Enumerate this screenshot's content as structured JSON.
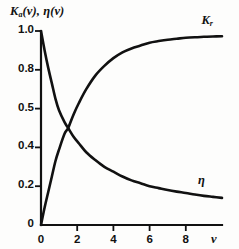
{
  "figure": {
    "background_color": "#fdfdfc",
    "ink_color": "#111111"
  },
  "labels": {
    "y_axis_title_k": "K",
    "y_axis_title_k_sub": "a",
    "y_axis_title_mid": "(v), ",
    "y_axis_title_eta": "η(v)",
    "x_axis_name": "v",
    "curve_k_label": "K",
    "curve_k_label_sub": "r",
    "curve_eta_label": "η"
  },
  "chart_data": {
    "type": "line",
    "xlabel": "v",
    "ylabel": "Kₐ(v), η(v)",
    "xlim": [
      0,
      10
    ],
    "ylim": [
      0,
      1.0
    ],
    "grid": false,
    "legend_position": "inline-curve-labels",
    "x_tick_labels": [
      "0",
      "2",
      "4",
      "6",
      "8"
    ],
    "x_tick_values": [
      0,
      2,
      4,
      6,
      8
    ],
    "y_tick_labels": [
      "1.0",
      "0.8",
      "0.5",
      "0.4",
      "0.2",
      "0"
    ],
    "y_tick_values": [
      1.0,
      0.8,
      0.6,
      0.4,
      0.2,
      0
    ],
    "annotations": [
      {
        "text": "Kᵣ",
        "x": 9.2,
        "y": 1.0
      },
      {
        "text": "η",
        "x": 8.9,
        "y": 0.22
      }
    ],
    "intersection": {
      "x": 1.5,
      "y": 0.5
    },
    "series": [
      {
        "name": "Kᵣ",
        "x": [
          0,
          0.2,
          0.4,
          0.6,
          0.8,
          1.0,
          1.3,
          1.5,
          1.8,
          2.1,
          2.5,
          3.0,
          3.5,
          4.0,
          4.5,
          5.0,
          5.5,
          6.0,
          6.5,
          7.0,
          7.5,
          8.0,
          8.5,
          9.0,
          9.5,
          10.0
        ],
        "values": [
          0.0,
          0.09,
          0.17,
          0.25,
          0.33,
          0.39,
          0.47,
          0.5,
          0.57,
          0.63,
          0.7,
          0.77,
          0.82,
          0.86,
          0.89,
          0.91,
          0.925,
          0.94,
          0.948,
          0.955,
          0.96,
          0.965,
          0.968,
          0.97,
          0.972,
          0.973
        ]
      },
      {
        "name": "η",
        "x": [
          0,
          0.2,
          0.4,
          0.6,
          0.8,
          1.0,
          1.3,
          1.5,
          1.8,
          2.1,
          2.5,
          3.0,
          3.5,
          4.0,
          4.5,
          5.0,
          5.5,
          6.0,
          6.5,
          7.0,
          7.5,
          8.0,
          8.5,
          9.0,
          9.5,
          10.0
        ],
        "values": [
          1.0,
          0.9,
          0.81,
          0.73,
          0.65,
          0.59,
          0.53,
          0.5,
          0.455,
          0.42,
          0.375,
          0.335,
          0.3,
          0.275,
          0.25,
          0.23,
          0.215,
          0.2,
          0.19,
          0.18,
          0.172,
          0.165,
          0.157,
          0.15,
          0.145,
          0.14
        ]
      }
    ]
  }
}
